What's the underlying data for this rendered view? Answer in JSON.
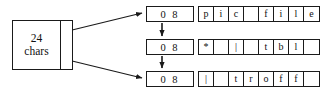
{
  "figure": {
    "background_color": "#ffffff",
    "line_color": "#1a1a1a"
  },
  "header_block": {
    "label": "24\nchars",
    "line1": "24",
    "line2": "chars"
  },
  "records": [
    {
      "count_label": "0 8",
      "cells": [
        "p",
        "i",
        "c",
        "",
        "f",
        "i",
        "l",
        "e"
      ]
    },
    {
      "count_label": "0 8",
      "cells": [
        "*",
        "",
        "|",
        "",
        "t",
        "b",
        "l",
        ""
      ]
    },
    {
      "count_label": "0 8",
      "cells": [
        "|",
        "",
        "t",
        "r",
        "o",
        "f",
        "f",
        ""
      ]
    }
  ]
}
